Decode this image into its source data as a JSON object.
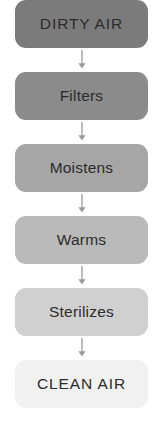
{
  "diagram": {
    "type": "vertical-flowchart",
    "background_color": "#ffffff",
    "text_color": "#2b2b2b",
    "arrow_color": "#9a9a9a",
    "steps": [
      {
        "label": "DIRTY AIR",
        "color": "#7b7b7b",
        "style": "uppercase"
      },
      {
        "label": "Filters",
        "color": "#8b8b8b",
        "style": "titlecase"
      },
      {
        "label": "Moistens",
        "color": "#a6a6a6",
        "style": "titlecase"
      },
      {
        "label": "Warms",
        "color": "#bababa",
        "style": "titlecase"
      },
      {
        "label": "Sterilizes",
        "color": "#d0d0d0",
        "style": "titlecase"
      },
      {
        "label": "CLEAN AIR",
        "color": "#f1f1f1",
        "style": "uppercase"
      }
    ],
    "connectors": [
      {
        "glyph": "arrow-down"
      },
      {
        "glyph": "arrow-down"
      },
      {
        "glyph": "arrow-down"
      },
      {
        "glyph": "arrow-down"
      },
      {
        "glyph": "arrow-down"
      }
    ]
  }
}
